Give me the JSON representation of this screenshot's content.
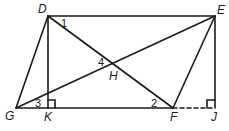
{
  "diagram": {
    "points": {
      "D": {
        "label": "D",
        "x": 48,
        "y": 16
      },
      "E": {
        "label": "E",
        "x": 215,
        "y": 16
      },
      "G": {
        "label": "G",
        "x": 16,
        "y": 108
      },
      "K": {
        "label": "K",
        "x": 48,
        "y": 108
      },
      "F": {
        "label": "F",
        "x": 173,
        "y": 108
      },
      "J": {
        "label": "J",
        "x": 215,
        "y": 108
      },
      "H": {
        "label": "H",
        "x": 114,
        "y": 64
      }
    },
    "angles": {
      "a1": "1",
      "a2": "2",
      "a3": "3",
      "a4": "4"
    },
    "segments": [
      "DE",
      "DG",
      "DK",
      "DF",
      "GE",
      "EF",
      "EJ",
      "GF"
    ],
    "dashed_segments": [
      "FJ"
    ],
    "right_angles": [
      "K",
      "J"
    ],
    "stroke_color": "#1a1a1a"
  }
}
